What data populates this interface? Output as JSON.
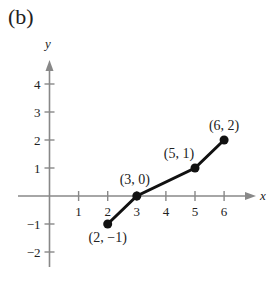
{
  "panel_label": "(b)",
  "chart_data": {
    "type": "line",
    "title": "(b)",
    "xlabel": "x",
    "ylabel": "y",
    "xlim": [
      0,
      7
    ],
    "ylim": [
      -2.5,
      4.8
    ],
    "x_ticks": [
      1,
      2,
      3,
      4,
      5,
      6
    ],
    "y_ticks": [
      -2,
      -1,
      1,
      2,
      3,
      4
    ],
    "x_tick_labels": [
      "1",
      "2",
      "3",
      "4",
      "5",
      "6"
    ],
    "y_tick_labels": [
      "−2",
      "−1",
      "1",
      "2",
      "3",
      "4"
    ],
    "grid": false,
    "series": [
      {
        "name": "piecewise",
        "x": [
          2,
          3,
          5,
          6
        ],
        "y": [
          -1,
          0,
          1,
          2
        ],
        "markers": true
      }
    ],
    "annotations": [
      {
        "text": "(2, −1)",
        "x": 2,
        "y": -1
      },
      {
        "text": "(3, 0)",
        "x": 3,
        "y": 0
      },
      {
        "text": "(5, 1)",
        "x": 5,
        "y": 1
      },
      {
        "text": "(6, 2)",
        "x": 6,
        "y": 2
      }
    ],
    "colors": {
      "axis": "#888888",
      "line": "#111111"
    }
  }
}
